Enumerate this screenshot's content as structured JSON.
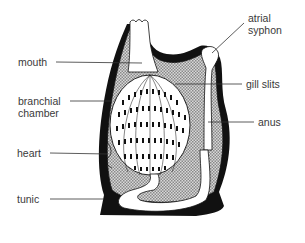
{
  "diagram": {
    "colors": {
      "outline": "#111111",
      "shading": "#bdbdbd",
      "background": "#ffffff",
      "label_text": "#3a3a3a"
    },
    "labels": {
      "mouth": "mouth",
      "branchial_1": "branchial",
      "branchial_2": "chamber",
      "heart": "heart",
      "tunic": "tunic",
      "atrial_1": "atrial",
      "atrial_2": "syphon",
      "gill_slits": "gill slits",
      "anus": "anus"
    }
  }
}
